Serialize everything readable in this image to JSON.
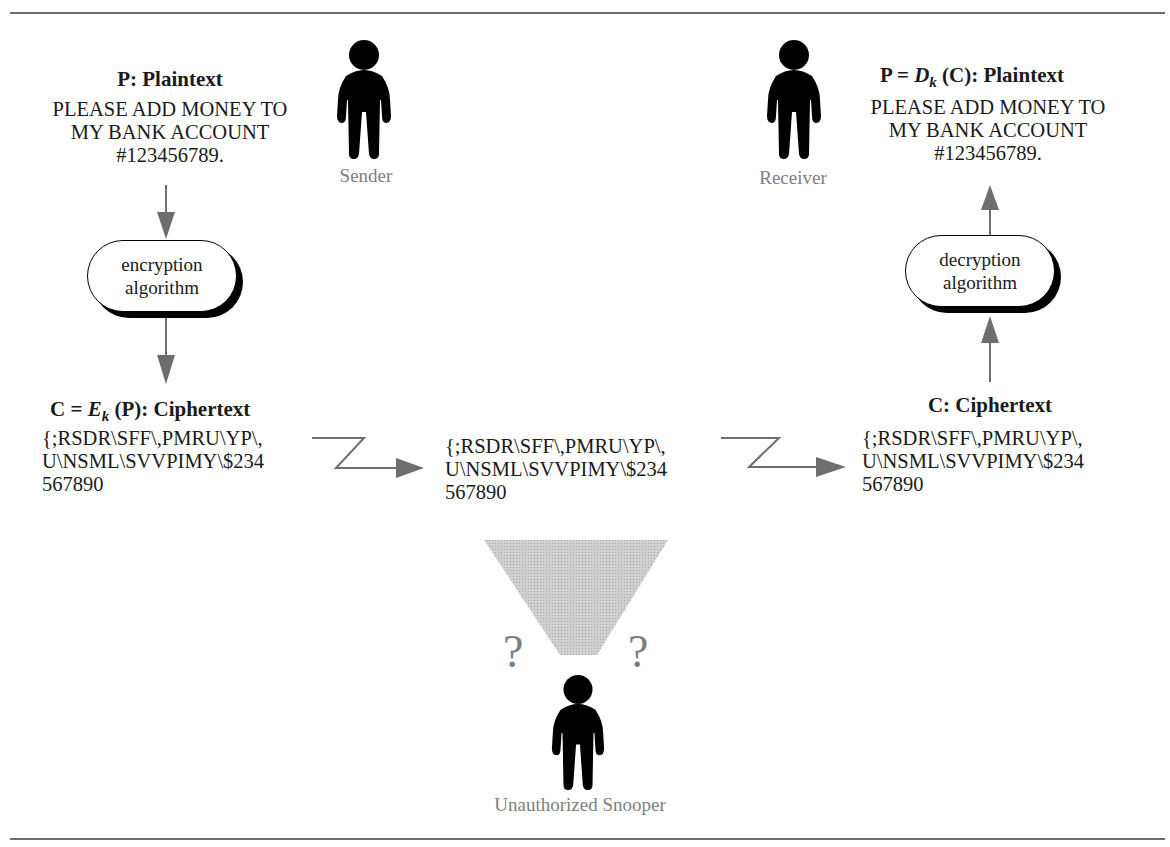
{
  "figure": {
    "title_partial": "Figure: Encryption and Decryption"
  },
  "sender": {
    "label": "Sender",
    "icon": "person-silhouette-icon",
    "plaintext_heading": "P:  Plaintext",
    "plaintext_lines": [
      "PLEASE ADD MONEY TO",
      "MY BANK ACCOUNT",
      "#123456789."
    ]
  },
  "encryption": {
    "line1": "encryption",
    "line2": "algorithm"
  },
  "ciphertext_sender": {
    "heading_prefix": "C = ",
    "heading_fn": "E",
    "heading_sub": "k",
    "heading_suffix": " (P):  Ciphertext",
    "lines": [
      "{;RSDR\\SFF\\,PMRU\\YP\\,",
      "U\\NSML\\SVVPIMY\\$234",
      "567890"
    ]
  },
  "ciphertext_transit": {
    "lines": [
      "{;RSDR\\SFF\\,PMRU\\YP\\,",
      "U\\NSML\\SVVPIMY\\$234",
      "567890"
    ]
  },
  "ciphertext_receiver": {
    "heading": "C:  Ciphertext",
    "lines": [
      "{;RSDR\\SFF\\,PMRU\\YP\\,",
      "U\\NSML\\SVVPIMY\\$234",
      "567890"
    ]
  },
  "decryption": {
    "line1": "decryption",
    "line2": "algorithm"
  },
  "receiver": {
    "label": "Receiver",
    "icon": "person-silhouette-icon",
    "plaintext_heading_prefix": "P = ",
    "plaintext_heading_fn": "D",
    "plaintext_heading_sub": "k",
    "plaintext_heading_suffix": " (C): Plaintext",
    "plaintext_lines": [
      "PLEASE ADD MONEY TO",
      "MY BANK ACCOUNT",
      "#123456789."
    ]
  },
  "snooper": {
    "label": "Unauthorized Snooper",
    "icon": "person-silhouette-icon",
    "question_left": "?",
    "question_right": "?"
  },
  "colors": {
    "arrow": "#6e6e6e",
    "caption": "#808080",
    "funnel": "#c4c4c4",
    "rule": "#6e6e6e"
  }
}
